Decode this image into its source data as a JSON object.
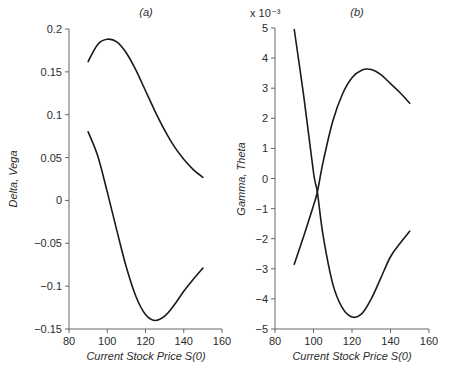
{
  "chart_data": [
    {
      "type": "line",
      "title": "(a)",
      "xlabel": "Current Stock Price S(0)",
      "ylabel": "Delta, Vega",
      "xlim": [
        80,
        160
      ],
      "ylim": [
        -0.15,
        0.2
      ],
      "xticks": [
        "80",
        "100",
        "120",
        "140",
        "160"
      ],
      "yticks": [
        "0.2",
        "0.15",
        "0.1",
        "0.05",
        "0",
        "−0.05",
        "−0.1",
        "−0.15"
      ],
      "grid": false,
      "x": [
        90,
        95,
        100,
        105,
        110,
        115,
        120,
        125,
        130,
        135,
        140,
        145,
        150
      ],
      "series": [
        {
          "name": "upper curve",
          "values": [
            0.162,
            0.182,
            0.188,
            0.185,
            0.172,
            0.152,
            0.128,
            0.104,
            0.082,
            0.063,
            0.048,
            0.036,
            0.027
          ]
        },
        {
          "name": "lower curve",
          "values": [
            0.08,
            0.052,
            0.01,
            -0.035,
            -0.078,
            -0.112,
            -0.133,
            -0.14,
            -0.135,
            -0.122,
            -0.106,
            -0.092,
            -0.079
          ]
        }
      ]
    },
    {
      "type": "line",
      "title": "(b)",
      "xlabel": "Current Stock Price S(0)",
      "ylabel": "Gamma, Theta",
      "y_multiplier": "x 10⁻³",
      "xlim": [
        80,
        160
      ],
      "ylim": [
        -5,
        5
      ],
      "xticks": [
        "80",
        "100",
        "120",
        "140",
        "160"
      ],
      "yticks": [
        "5",
        "4",
        "3",
        "2",
        "1",
        "0",
        "−1",
        "−2",
        "−3",
        "−4",
        "−5"
      ],
      "grid": false,
      "x": [
        90,
        95,
        100,
        102,
        105,
        110,
        115,
        120,
        125,
        130,
        135,
        140,
        145,
        150
      ],
      "series": [
        {
          "name": "descending curve",
          "values": [
            4.95,
            2.7,
            0.2,
            -0.45,
            -1.9,
            -3.5,
            -4.3,
            -4.6,
            -4.5,
            -4.0,
            -3.3,
            -2.6,
            -2.15,
            -1.75
          ]
        },
        {
          "name": "rising curve",
          "values": [
            -2.85,
            -1.9,
            -0.9,
            -0.45,
            0.55,
            1.9,
            2.8,
            3.35,
            3.6,
            3.62,
            3.45,
            3.15,
            2.85,
            2.5
          ]
        }
      ]
    }
  ]
}
